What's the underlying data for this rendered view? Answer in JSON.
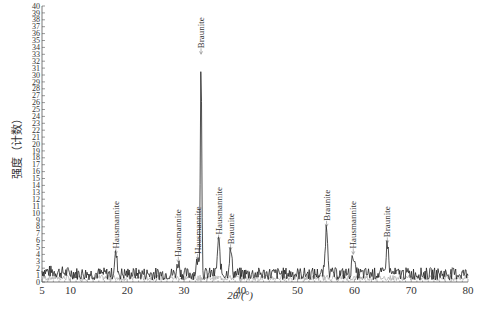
{
  "chart_data": {
    "type": "line",
    "title": "",
    "xlabel": "2θ/(°)",
    "ylabel": "强度（计数）",
    "xlim": [
      5,
      80
    ],
    "ylim": [
      0,
      40
    ],
    "x_ticks": [
      5,
      10,
      20,
      30,
      40,
      50,
      60,
      70,
      80
    ],
    "y_ticks": [
      0,
      1,
      2,
      3,
      4,
      5,
      6,
      7,
      8,
      9,
      10,
      11,
      12,
      13,
      14,
      15,
      16,
      17,
      18,
      19,
      20,
      21,
      22,
      23,
      24,
      25,
      26,
      27,
      28,
      29,
      30,
      31,
      32,
      33,
      34,
      35,
      36,
      37,
      38,
      39,
      40
    ],
    "grid": false,
    "legend": null,
    "baseline_noise": {
      "mean": 1.2,
      "amplitude": 0.9
    },
    "peaks": [
      {
        "x": 18.0,
        "y": 4.0,
        "label": "Hausmannite"
      },
      {
        "x": 29.0,
        "y": 2.8,
        "label": "Hausmannite"
      },
      {
        "x": 32.4,
        "y": 3.2,
        "label": "Hausmannite"
      },
      {
        "x": 33.0,
        "y": 33.0,
        "label": "Braunite"
      },
      {
        "x": 36.1,
        "y": 6.0,
        "label": "Hausmannite"
      },
      {
        "x": 38.2,
        "y": 4.6,
        "label": "Braunite"
      },
      {
        "x": 55.1,
        "y": 8.0,
        "label": "Braunite"
      },
      {
        "x": 59.8,
        "y": 4.0,
        "label": "Hausmannite"
      },
      {
        "x": 65.8,
        "y": 5.6,
        "label": "Braunite"
      }
    ]
  }
}
